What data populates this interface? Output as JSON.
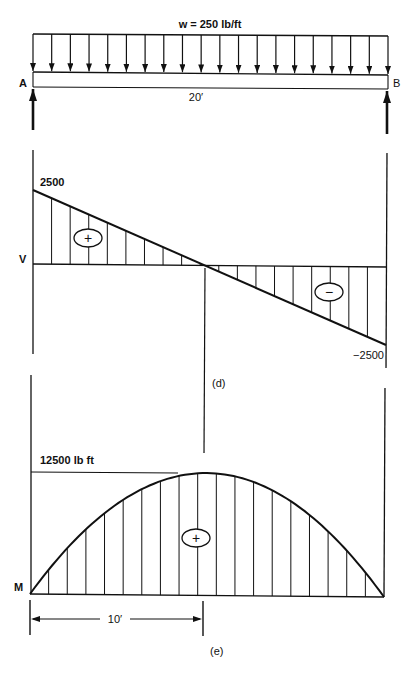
{
  "load_diagram": {
    "load_label": "w = 250 lb/ft",
    "support_left_label": "A",
    "support_right_label": "B",
    "span_label": "20′",
    "arrow_count": 20,
    "icons": [
      "distributed-load-arrow-icon",
      "reaction-arrow-icon"
    ]
  },
  "shear_diagram": {
    "axis_label": "V",
    "max_label": "2500",
    "min_label": "−2500",
    "positive_sign": "+",
    "negative_sign": "−",
    "caption": "(d)"
  },
  "moment_diagram": {
    "axis_label": "M",
    "max_label": "12500 lb ft",
    "positive_sign": "+",
    "dimension_label": "10′",
    "caption": "(e)"
  },
  "colors": {
    "ink": "#111111",
    "background": "#ffffff"
  }
}
